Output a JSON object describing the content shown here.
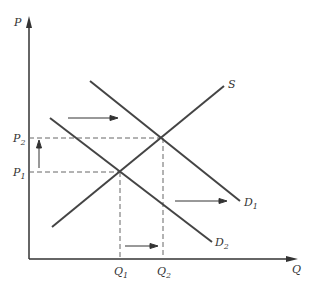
{
  "diagram": {
    "axes": {
      "y_label": "P",
      "x_label": "Q"
    },
    "price_labels": [
      {
        "base": "P",
        "sub": "2"
      },
      {
        "base": "P",
        "sub": "1"
      }
    ],
    "quantity_labels": [
      {
        "base": "Q",
        "sub": "1"
      },
      {
        "base": "Q",
        "sub": "2"
      }
    ],
    "curves": [
      {
        "name": "S",
        "label": "S",
        "sub": ""
      },
      {
        "name": "D1",
        "label": "D",
        "sub": "1"
      },
      {
        "name": "D2",
        "label": "D",
        "sub": "2"
      }
    ],
    "colors": {
      "line": "#444444",
      "dashed": "#666666",
      "text": "#333333"
    }
  }
}
